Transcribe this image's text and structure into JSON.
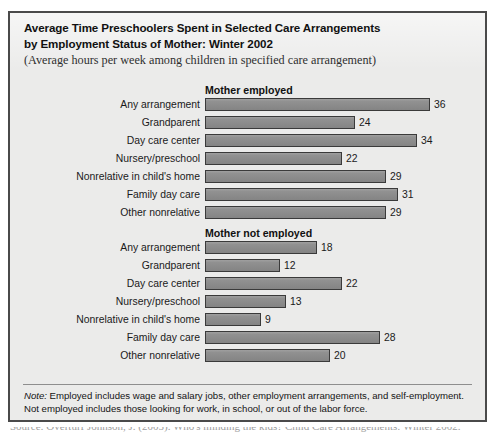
{
  "figure": {
    "title_line_1": "Average Time Preschoolers Spent in Selected Care Arrangements",
    "title_line_2": "by Employment Status of Mother: Winter 2002",
    "subtitle": "(Average hours per week among children in specified care arrangement)",
    "note_label": "Note:",
    "note_line_1": " Employed includes wage and salary jobs, other employment arrangements, and self-employment.",
    "note_line_2": "Not employed includes those looking for work, in school, or out of the labor force.",
    "source_cutoff": "Source: Overturf Johnson, J. (2005). Who's minding the kids? Child Care Arrangements: Winter 2002."
  },
  "chart_data": {
    "type": "bar",
    "orientation": "horizontal",
    "title": "Average Time Preschoolers Spent in Selected Care Arrangements by Employment Status of Mother: Winter 2002",
    "subtitle": "(Average hours per week among children in specified care arrangement)",
    "xlabel": "Average hours per week",
    "ylabel": "",
    "xlim": [
      0,
      36
    ],
    "grid": false,
    "legend": "none",
    "bar_color": "#8b8b8b",
    "bar_border_color": "#3a3a3a",
    "categories": [
      "Any arrangement",
      "Grandparent",
      "Day care center",
      "Nursery/preschool",
      "Nonrelative in child's home",
      "Family day care",
      "Other nonrelative"
    ],
    "series": [
      {
        "name": "Mother employed",
        "values": [
          36,
          24,
          34,
          22,
          29,
          31,
          29
        ]
      },
      {
        "name": "Mother not employed",
        "values": [
          18,
          12,
          22,
          13,
          9,
          28,
          20
        ]
      }
    ]
  }
}
